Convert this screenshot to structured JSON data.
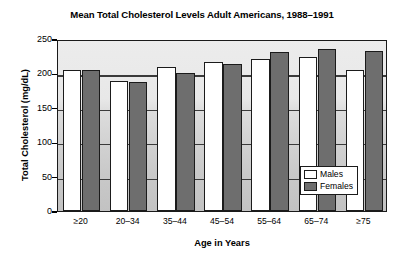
{
  "chart_data": {
    "type": "bar",
    "title": "Mean Total Cholesterol Levels Adult Americans, 1988–1991",
    "xlabel": "Age in Years",
    "ylabel": "Total Cholesterol (mg/dL)",
    "categories": [
      "≥20",
      "20–34",
      "35–44",
      "45–54",
      "55–64",
      "65–74",
      "≥75"
    ],
    "series": [
      {
        "name": "Males",
        "color": "#ffffff",
        "values": [
          205,
          189,
          209,
          216,
          221,
          224,
          205
        ]
      },
      {
        "name": "Females",
        "color": "#6e6e6e",
        "values": [
          205,
          188,
          201,
          214,
          231,
          235,
          233
        ]
      }
    ],
    "ylim": [
      0,
      250
    ],
    "yticks": [
      0,
      50,
      100,
      150,
      200,
      250
    ],
    "ytick_labels": [
      "0",
      "50",
      "100",
      "150",
      "200",
      "250"
    ],
    "grid": true,
    "legend_position": "inside-bottom-right"
  },
  "legend": {
    "items": [
      {
        "label": "Males"
      },
      {
        "label": "Females"
      }
    ]
  }
}
